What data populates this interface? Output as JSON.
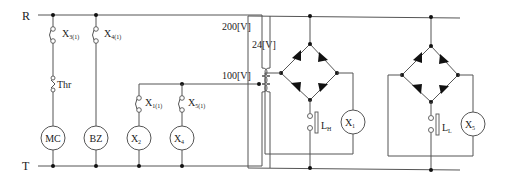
{
  "rails": {
    "top": "R",
    "bottom": "T"
  },
  "voltages": {
    "primary_high": "200[V]",
    "primary_tap": "100[V]",
    "secondary": "24[V]"
  },
  "control_circuit": {
    "branches": [
      {
        "contact": {
          "base": "X",
          "sub": "3(1)"
        },
        "extra": "Thr",
        "coil": "MC"
      },
      {
        "contact": {
          "base": "X",
          "sub": "4(1)"
        },
        "coil": "BZ"
      },
      {
        "contact": {
          "base": "X",
          "sub": "1(1)"
        },
        "coil": {
          "base": "X",
          "sub": "2"
        }
      },
      {
        "contact": {
          "base": "X",
          "sub": "5(1)"
        },
        "coil": {
          "base": "X",
          "sub": "4"
        }
      }
    ]
  },
  "rectifier_circuits": [
    {
      "electrode": {
        "base": "L",
        "sub": "H"
      },
      "relay": {
        "base": "X",
        "sub": "1"
      }
    },
    {
      "electrode": {
        "base": "L",
        "sub": "L"
      },
      "relay": {
        "base": "X",
        "sub": "5"
      }
    }
  ],
  "colors": {
    "wire": "#555555",
    "junction": "#111111",
    "text": "#222222"
  }
}
